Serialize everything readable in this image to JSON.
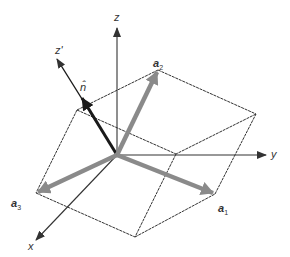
{
  "figure": {
    "axes": {
      "x": "x",
      "y": "y",
      "z": "z",
      "z_prime": "z'"
    },
    "normal_label": "n̂",
    "vectors": [
      {
        "name": "a",
        "sub": "1"
      },
      {
        "name": "a",
        "sub": "2"
      },
      {
        "name": "a",
        "sub": "3"
      }
    ],
    "colors": {
      "axis": "#333333",
      "cell_edge": "#333333",
      "lattice_vector": "#8a8a8a",
      "normal_vector": "#1a1a1a"
    }
  }
}
